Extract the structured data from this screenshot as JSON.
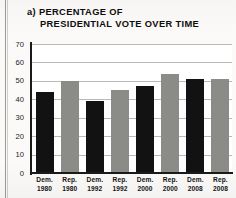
{
  "figure": {
    "label": "a)",
    "title_line1": "a) PERCENTAGE OF",
    "title_line2": "PRESIDENTIAL VOTE OVER TIME"
  },
  "colors": {
    "democrat_bar": "#121212",
    "republican_bar": "#8b8b88",
    "gridline": "#b9b9b6",
    "axis": "#1a1a1a",
    "paper": "#fbfaf8"
  },
  "chart_data": {
    "type": "bar",
    "title": "a) PERCENTAGE OF PRESIDENTIAL VOTE OVER TIME",
    "xlabel": "",
    "ylabel": "",
    "ylim": [
      0,
      70
    ],
    "yticks": [
      0,
      10,
      20,
      30,
      40,
      50,
      60,
      70
    ],
    "ytick_labels": [
      "0",
      "10",
      "20",
      "30",
      "40",
      "50",
      "60",
      "70"
    ],
    "grid": true,
    "grid_axis": "y",
    "legend": false,
    "categories": [
      "Dem. 1980",
      "Rep. 1980",
      "Dem. 1992",
      "Rep. 1992",
      "Dem. 2000",
      "Rep. 2000",
      "Dem. 2008",
      "Rep. 2008"
    ],
    "category_lines": [
      {
        "party": "Dem.",
        "year": "1980"
      },
      {
        "party": "Rep.",
        "year": "1980"
      },
      {
        "party": "Dem.",
        "year": "1992"
      },
      {
        "party": "Rep.",
        "year": "1992"
      },
      {
        "party": "Dem.",
        "year": "2000"
      },
      {
        "party": "Rep.",
        "year": "2000"
      },
      {
        "party": "Dem.",
        "year": "2008"
      },
      {
        "party": "Rep.",
        "year": "2008"
      }
    ],
    "values": [
      44,
      50,
      39,
      45,
      47,
      54,
      51,
      51
    ],
    "bar_colors": [
      "#121212",
      "#8b8b88",
      "#121212",
      "#8b8b88",
      "#121212",
      "#8b8b88",
      "#121212",
      "#8b8b88"
    ]
  }
}
